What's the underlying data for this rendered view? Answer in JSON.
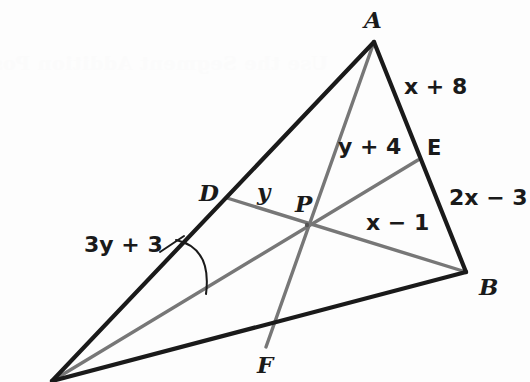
{
  "figure": {
    "background_color": "#fdfdfd",
    "stroke_dark": "#1a1a1a",
    "stroke_gray": "#777777",
    "bleed_through_text": "Use the Segment Addition Postulate",
    "vertices": [
      {
        "name": "A",
        "label": "A",
        "x": 374,
        "y": 42
      },
      {
        "name": "B",
        "label": "B",
        "x": 466,
        "y": 272
      },
      {
        "name": "C",
        "label": "C",
        "x": 52,
        "y": 381
      }
    ],
    "points": [
      {
        "name": "D",
        "label": "D",
        "x": 227,
        "y": 198,
        "on_segment": "AC"
      },
      {
        "name": "E",
        "label": "E",
        "x": 418,
        "y": 160,
        "on_segment": "AB"
      },
      {
        "name": "F",
        "label": "F",
        "x": 266,
        "y": 347,
        "on_segment": "CB"
      },
      {
        "name": "P",
        "label": "P",
        "x": 307,
        "y": 225,
        "on_segment": "intersection"
      }
    ],
    "sides": [
      {
        "name": "side-AB",
        "from": "A",
        "to": "B",
        "color": "dark"
      },
      {
        "name": "side-AC",
        "from": "A",
        "to": "C",
        "color": "dark"
      },
      {
        "name": "side-CB",
        "from": "C",
        "to": "B",
        "color": "dark"
      }
    ],
    "cevians": [
      {
        "name": "cevian-AF",
        "from": "A",
        "to": "F",
        "color": "gray"
      },
      {
        "name": "cevian-BD",
        "from": "B",
        "to": "D",
        "color": "gray"
      },
      {
        "name": "cevian-CE",
        "from": "C",
        "to": "E",
        "color": "gray"
      }
    ],
    "labels": {
      "vertex_a": "A",
      "vertex_b": "B",
      "point_d": "D",
      "point_e": "E",
      "point_f": "F",
      "point_p": "P",
      "seg_ae": "x + 8",
      "seg_eb": "2x − 3",
      "seg_ap": "y + 4",
      "seg_dp": "y",
      "seg_pb": "x − 1",
      "seg_cd": "3y + 3"
    },
    "label_positions": {
      "vertex_a": {
        "x": 364,
        "y": 8
      },
      "vertex_b": {
        "x": 479,
        "y": 275
      },
      "point_d": {
        "x": 199,
        "y": 181
      },
      "point_e": {
        "x": 427,
        "y": 138
      },
      "point_f": {
        "x": 257,
        "y": 353
      },
      "point_p": {
        "x": 295,
        "y": 192
      },
      "seg_ae": {
        "x": 404,
        "y": 76
      },
      "seg_eb": {
        "x": 449,
        "y": 187
      },
      "seg_ap": {
        "x": 338,
        "y": 136
      },
      "seg_dp": {
        "x": 257,
        "y": 180
      },
      "seg_pb": {
        "x": 366,
        "y": 212
      },
      "seg_cd": {
        "x": 84,
        "y": 234
      }
    }
  }
}
